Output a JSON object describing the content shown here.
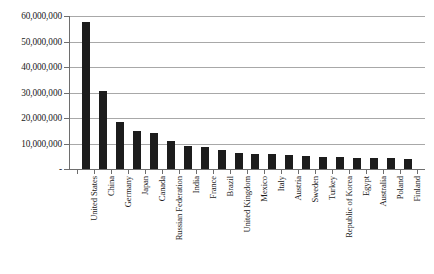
{
  "chart_data": {
    "type": "bar",
    "title": "",
    "subtitle": "",
    "xlabel": "",
    "ylabel": "",
    "ylim": [
      0,
      60000000
    ],
    "ytick_values": [
      0,
      10000000,
      20000000,
      30000000,
      40000000,
      50000000,
      60000000
    ],
    "ytick_labels": [
      "-",
      "10,000,000",
      "20,000,000",
      "30,000,000",
      "40,000,000",
      "50,000,000",
      "60,000,000"
    ],
    "grid": true,
    "legend": false,
    "legend_position": "none",
    "bar_color": "#1c1c1c",
    "gridline_color": "#a8a8a8",
    "axis_color": "#6e6e6e",
    "categories": [
      "United States",
      "China",
      "Germany",
      "Japan",
      "Canada",
      "Russian Federation",
      "India",
      "France",
      "Brazil",
      "United Kingdom",
      "Mexico",
      "Italy",
      "Austria",
      "Sweden",
      "Turkey",
      "Republic of Korea",
      "Egypt",
      "Australia",
      "Poland",
      "Finland"
    ],
    "values": [
      57800000,
      30400000,
      18300000,
      15100000,
      14300000,
      10900000,
      9100000,
      8600000,
      7600000,
      6100000,
      6000000,
      5700000,
      5400000,
      5200000,
      4900000,
      4700000,
      4500000,
      4400000,
      4200000,
      4000000
    ]
  }
}
